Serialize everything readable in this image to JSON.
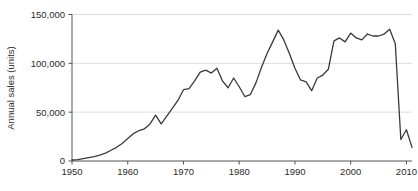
{
  "chart_data": {
    "type": "line",
    "title": "",
    "xlabel": "",
    "ylabel": "Annual sales (units)",
    "xlim": [
      1950,
      2011
    ],
    "ylim": [
      0,
      150000
    ],
    "xticks": [
      1950,
      1960,
      1970,
      1980,
      1990,
      2000,
      2010
    ],
    "xticklabels": [
      "1950",
      "1960",
      "1970",
      "1980",
      "1990",
      "2000",
      "2010"
    ],
    "yticks": [
      0,
      50000,
      100000,
      150000
    ],
    "yticklabels": [
      "0",
      "50,000",
      "100,000",
      "150,000"
    ],
    "grid": "horizontal",
    "legend": "none",
    "series": [
      {
        "name": "Annual sales",
        "color": "#3a3a3a",
        "x": [
          1950,
          1951,
          1952,
          1953,
          1954,
          1955,
          1956,
          1957,
          1958,
          1959,
          1960,
          1961,
          1962,
          1963,
          1964,
          1965,
          1966,
          1967,
          1968,
          1969,
          1970,
          1971,
          1972,
          1973,
          1974,
          1975,
          1976,
          1977,
          1978,
          1979,
          1980,
          1981,
          1982,
          1983,
          1984,
          1985,
          1986,
          1987,
          1988,
          1989,
          1990,
          1991,
          1992,
          1993,
          1994,
          1995,
          1996,
          1997,
          1998,
          1999,
          2000,
          2001,
          2002,
          2003,
          2004,
          2005,
          2006,
          2007,
          2008,
          2009,
          2010,
          2011
        ],
        "values": [
          1000,
          1500,
          2500,
          3500,
          4500,
          6000,
          8000,
          11000,
          14000,
          18000,
          23000,
          28000,
          31000,
          33000,
          38000,
          47000,
          38000,
          46000,
          54000,
          62000,
          73000,
          74000,
          82000,
          91000,
          93000,
          90000,
          95000,
          82000,
          75000,
          85000,
          76000,
          66000,
          68000,
          80000,
          96000,
          110000,
          122000,
          134000,
          124000,
          110000,
          95000,
          83000,
          81000,
          72000,
          85000,
          88000,
          94000,
          123000,
          126000,
          122000,
          131000,
          126000,
          124000,
          130000,
          128000,
          128000,
          130000,
          135000,
          120000,
          22000,
          32000,
          14000
        ]
      }
    ]
  },
  "axes": {
    "y_title": "Annual sales (units)"
  }
}
